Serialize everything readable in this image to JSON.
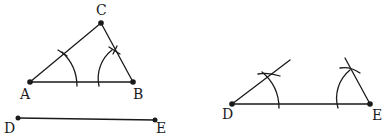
{
  "figure": {
    "stroke_color": "#1a1a1a",
    "left": {
      "triangle": {
        "points": {
          "A": {
            "label": "A",
            "x": 30,
            "y": 82
          },
          "B": {
            "label": "B",
            "x": 133,
            "y": 82
          },
          "C": {
            "label": "C",
            "x": 101,
            "y": 23
          }
        },
        "arcs": [
          "arc-at-A",
          "arc-at-B"
        ]
      },
      "segment": {
        "D": {
          "label": "D",
          "x": 18,
          "y": 118
        },
        "E": {
          "label": "E",
          "x": 155,
          "y": 120
        }
      }
    },
    "right": {
      "segment": {
        "D": {
          "label": "D",
          "x": 232,
          "y": 104
        },
        "E": {
          "label": "E",
          "x": 370,
          "y": 104
        }
      },
      "rays": [
        "ray-from-D",
        "ray-from-E"
      ],
      "arcs": [
        "arc-at-D",
        "arc-at-E"
      ]
    }
  }
}
